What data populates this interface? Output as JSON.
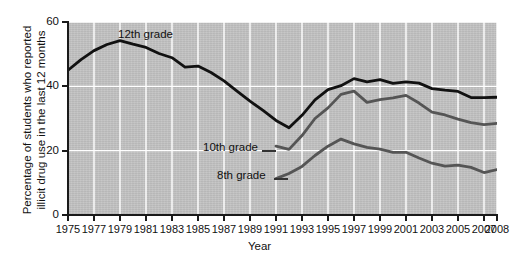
{
  "chart_data": {
    "type": "line",
    "title": "",
    "xlabel": "Year",
    "ylabel": "Percentage of students who reported illicit drug use in the last 12 months",
    "xlim": [
      1975,
      2008
    ],
    "ylim": [
      0,
      60
    ],
    "yticks": [
      0,
      20,
      40,
      60
    ],
    "ytick_labels": [
      "0",
      "20",
      "40",
      "60"
    ],
    "xticks": [
      1975,
      1977,
      1979,
      1981,
      1983,
      1985,
      1987,
      1989,
      1991,
      1993,
      1995,
      1997,
      1999,
      2001,
      2003,
      2005,
      2007,
      2008
    ],
    "xtick_labels": [
      "1975",
      "1977",
      "1979",
      "1981",
      "1983",
      "1985",
      "1987",
      "1989",
      "1991",
      "1993",
      "1995",
      "1997",
      "1999",
      "2001",
      "2003",
      "2005",
      "2007",
      "2008"
    ],
    "grid": true,
    "grid_color": "#ffffff",
    "plot_background": "#c3c3c3",
    "legend_position": "inline-labels",
    "series": [
      {
        "name": "12th grade",
        "color": "#111111",
        "x": [
          1975,
          1976,
          1977,
          1978,
          1979,
          1980,
          1981,
          1982,
          1983,
          1984,
          1985,
          1986,
          1987,
          1988,
          1989,
          1990,
          1991,
          1992,
          1993,
          1994,
          1995,
          1996,
          1997,
          1998,
          1999,
          2000,
          2001,
          2002,
          2003,
          2004,
          2005,
          2006,
          2007,
          2008
        ],
        "values": [
          45.0,
          48.3,
          51.1,
          53.0,
          54.2,
          53.1,
          52.1,
          50.2,
          48.9,
          46.0,
          46.3,
          44.3,
          41.7,
          38.5,
          35.4,
          32.5,
          29.4,
          27.1,
          31.0,
          35.8,
          39.0,
          40.2,
          42.4,
          41.4,
          42.1,
          40.9,
          41.4,
          41.0,
          39.3,
          38.8,
          38.4,
          36.5,
          36.5,
          36.6
        ]
      },
      {
        "name": "10th grade",
        "color": "#555555",
        "x": [
          1991,
          1992,
          1993,
          1994,
          1995,
          1996,
          1997,
          1998,
          1999,
          2000,
          2001,
          2002,
          2003,
          2004,
          2005,
          2006,
          2007,
          2008
        ],
        "values": [
          21.4,
          20.4,
          24.7,
          30.0,
          33.3,
          37.5,
          38.5,
          35.0,
          35.9,
          36.4,
          37.2,
          34.8,
          32.0,
          31.1,
          29.8,
          28.7,
          28.1,
          28.5
        ]
      },
      {
        "name": "8th grade",
        "color": "#555555",
        "x": [
          1991,
          1992,
          1993,
          1994,
          1995,
          1996,
          1997,
          1998,
          1999,
          2000,
          2001,
          2002,
          2003,
          2004,
          2005,
          2006,
          2007,
          2008
        ],
        "values": [
          11.3,
          12.9,
          15.1,
          18.5,
          21.4,
          23.6,
          22.1,
          21.0,
          20.5,
          19.5,
          19.5,
          17.7,
          16.1,
          15.2,
          15.5,
          14.8,
          13.2,
          14.1
        ]
      }
    ]
  },
  "labels": {
    "series_12th": "12th grade",
    "series_10th": "10th grade",
    "series_8th": "8th grade",
    "x_axis_title": "Year",
    "y_axis_title_line1": "Percentage of students who reported",
    "y_axis_title_line2": "illicit drug use in the last 12 months"
  }
}
